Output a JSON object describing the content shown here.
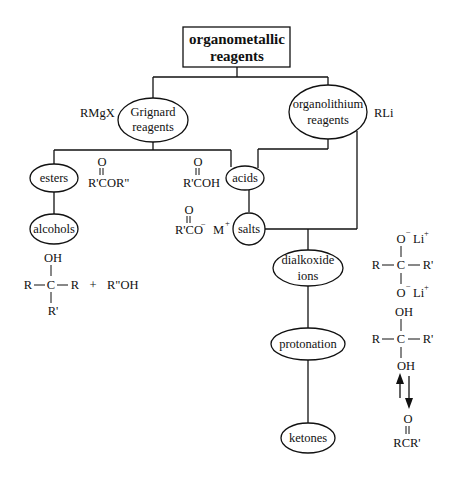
{
  "diagram": {
    "root": {
      "line1": "organometallic",
      "line2": "reagents"
    },
    "nodes": {
      "grignard": {
        "line1": "Grignard",
        "line2": "reagents",
        "formula": "RMgX"
      },
      "organolithium": {
        "line1": "organolithium",
        "line2": "reagents",
        "formula": "RLi"
      },
      "esters": {
        "label": "esters"
      },
      "alcohols": {
        "label": "alcohols"
      },
      "acids": {
        "label": "acids"
      },
      "salts": {
        "label": "salts"
      },
      "dialkoxide": {
        "line1": "dialkoxide",
        "line2": "ions"
      },
      "protonation": {
        "label": "protonation"
      },
      "ketones": {
        "label": "ketones"
      }
    },
    "structures": {
      "ester": {
        "carbonyl_o": "O",
        "formula": "R'COR\""
      },
      "acid": {
        "carbonyl_o": "O",
        "formula": "R'COH"
      },
      "salt": {
        "carbonyl_o": "O",
        "formula": "R'CO",
        "charge": "−",
        "cation": "M",
        "cation_charge": "+"
      },
      "alcohol_product": {
        "top": "OH",
        "left": "R",
        "center": "C",
        "right": "R",
        "bottom": "R'",
        "plus": "+",
        "byproduct": "R\"OH"
      },
      "dialkoxide_ion": {
        "top_o": "O",
        "top_o_charge": "−",
        "top_li": "Li",
        "top_li_charge": "+",
        "left": "R",
        "center": "C",
        "right": "R'",
        "bottom_o": "O",
        "bottom_o_charge": "−",
        "bottom_li": "Li",
        "bottom_li_charge": "+"
      },
      "gem_diol": {
        "top": "OH",
        "left": "R",
        "center": "C",
        "right": "R'",
        "bottom": "OH"
      },
      "ketone": {
        "carbonyl_o": "O",
        "formula": "RCR'"
      }
    },
    "edges": [
      [
        "organometallic reagents",
        "Grignard reagents"
      ],
      [
        "organometallic reagents",
        "organolithium reagents"
      ],
      [
        "Grignard reagents",
        "esters"
      ],
      [
        "Grignard reagents",
        "acids"
      ],
      [
        "organolithium reagents",
        "acids"
      ],
      [
        "esters",
        "alcohols"
      ],
      [
        "acids",
        "salts"
      ],
      [
        "salts",
        "dialkoxide ions"
      ],
      [
        "organolithium reagents",
        "dialkoxide ions"
      ],
      [
        "dialkoxide ions",
        "protonation"
      ],
      [
        "protonation",
        "ketones"
      ]
    ],
    "equilibrium_arrows": {
      "up": "↑",
      "down": "↓"
    },
    "colors": {
      "ink": "#111111",
      "background": "#ffffff"
    }
  }
}
